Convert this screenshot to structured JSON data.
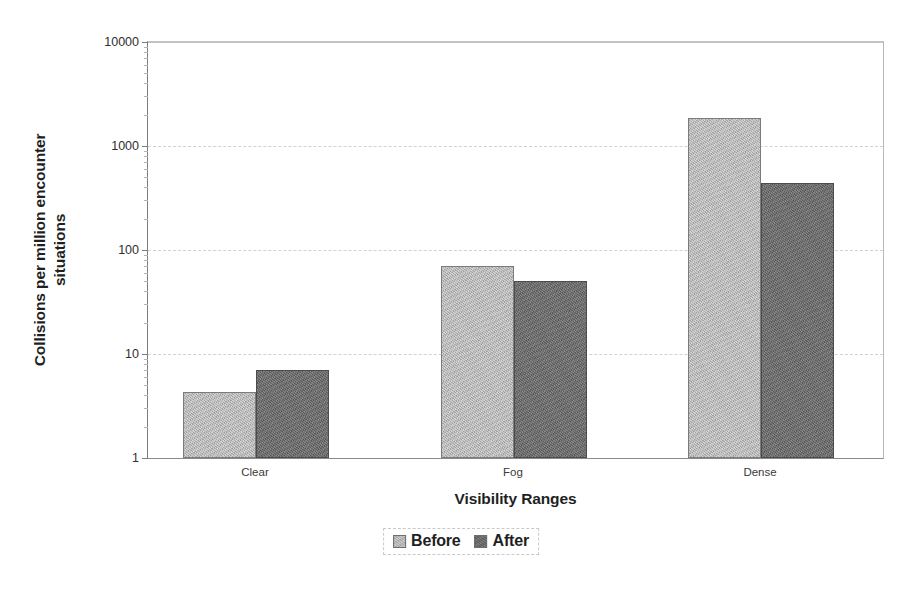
{
  "chart_data": {
    "type": "bar",
    "title": "",
    "xlabel": "Visibility Ranges",
    "ylabel": "Collisions per million encounter situations",
    "categories": [
      "Clear",
      "Fog",
      "Dense"
    ],
    "series": [
      {
        "name": "Before",
        "values": [
          4.3,
          70,
          1850
        ],
        "color": "#b2b2b2"
      },
      {
        "name": "After",
        "values": [
          7,
          50,
          440
        ],
        "color": "#666666"
      }
    ],
    "yscale": "log",
    "ylim": [
      1,
      10000
    ],
    "ytick_labels": [
      "1",
      "10",
      "100",
      "1000",
      "10000"
    ],
    "ytick_values": [
      1,
      10,
      100,
      1000,
      10000
    ],
    "grid": "horizontal-dashed",
    "legend_position": "bottom-center",
    "legend_entries": [
      "Before",
      "After"
    ]
  },
  "axes": {
    "y_title": "Collisions per million encounter situations",
    "y_title_line1": "Collisions per million encounter",
    "y_title_line2": "situations",
    "x_title": "Visibility Ranges"
  }
}
